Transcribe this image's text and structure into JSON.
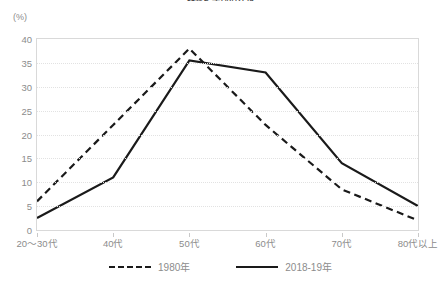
{
  "chart_data": {
    "type": "line",
    "title": "図表2 年代別分布",
    "unit_label": "(%)",
    "xlabel": "",
    "ylabel": "",
    "ylim": [
      0,
      40
    ],
    "ytick_step": 5,
    "yticks": [
      "40",
      "35",
      "30",
      "25",
      "20",
      "15",
      "10",
      "5",
      "0"
    ],
    "grid": true,
    "legend_position": "bottom",
    "categories": [
      "20〜30代",
      "40代",
      "50代",
      "60代",
      "70代",
      "80代以上"
    ],
    "series": [
      {
        "name": "1980年",
        "style": "dashed",
        "color": "#1a1a1a",
        "values": [
          6,
          22,
          38,
          22,
          8.5,
          2
        ]
      },
      {
        "name": "2018-19年",
        "style": "solid",
        "color": "#1a1a1a",
        "values": [
          2.5,
          11,
          35.5,
          33,
          14,
          5
        ]
      }
    ]
  },
  "colors": {
    "frame": "#d9d9d9",
    "grid": "#e2e2e2",
    "text": "#8c8c8c",
    "line": "#1a1a1a",
    "background": "#ffffff"
  }
}
